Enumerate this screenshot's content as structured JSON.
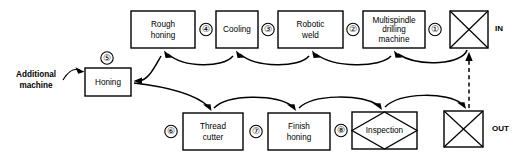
{
  "diagram": {
    "type": "manufacturing-process-flow",
    "title": "",
    "nodes": [
      {
        "id": "in",
        "label": "IN",
        "shape": "crossed-square",
        "step": "",
        "row": "top",
        "x": 450,
        "y": 11,
        "w": 38,
        "h": 37
      },
      {
        "id": "multispindle",
        "label": "Multispindle drilling machine",
        "shape": "rect",
        "step": "①",
        "row": "top",
        "x": 363,
        "y": 11,
        "w": 62,
        "h": 37
      },
      {
        "id": "robotic",
        "label": "Robotic weld",
        "shape": "rect",
        "step": "②",
        "row": "top",
        "x": 278,
        "y": 11,
        "w": 65,
        "h": 37
      },
      {
        "id": "cooling",
        "label": "Cooling",
        "shape": "rect",
        "step": "③",
        "row": "top",
        "x": 216,
        "y": 11,
        "w": 42,
        "h": 37
      },
      {
        "id": "rough",
        "label": "Rough honing",
        "shape": "rect",
        "step": "④",
        "row": "top",
        "x": 131,
        "y": 11,
        "w": 64,
        "h": 37
      },
      {
        "id": "honing",
        "label": "Honing",
        "shape": "rect",
        "step": "⑤",
        "row": "middle",
        "x": 85,
        "y": 68,
        "w": 46,
        "h": 28
      },
      {
        "id": "thread",
        "label": "Thread cutter",
        "shape": "rect",
        "step": "⑥",
        "row": "bottom",
        "x": 183,
        "y": 113,
        "w": 60,
        "h": 37
      },
      {
        "id": "finish",
        "label": "Finish honing",
        "shape": "rect",
        "step": "⑦",
        "row": "bottom",
        "x": 268,
        "y": 113,
        "w": 62,
        "h": 37
      },
      {
        "id": "inspection",
        "label": "Inspection",
        "shape": "diamond-in-rect",
        "step": "⑧",
        "row": "bottom",
        "x": 352,
        "y": 112,
        "w": 65,
        "h": 37
      },
      {
        "id": "out",
        "label": "OUT",
        "shape": "crossed-square",
        "step": "",
        "row": "bottom",
        "x": 444,
        "y": 111,
        "w": 39,
        "h": 36
      }
    ],
    "node_labels": {
      "rough_honing_line1": "Rough",
      "rough_honing_line2": "honing",
      "cooling": "Cooling",
      "robotic_line1": "Robotic",
      "robotic_line2": "weld",
      "multispindle_line1": "Multispindle",
      "multispindle_line2": "drilling",
      "multispindle_line3": "machine",
      "honing": "Honing",
      "thread_line1": "Thread",
      "thread_line2": "cutter",
      "finish_line1": "Finish",
      "finish_line2": "honing",
      "inspection": "Inspection",
      "additional_line1": "Additional",
      "additional_line2": "machine",
      "in": "IN",
      "out": "OUT"
    },
    "step_numbers": {
      "multispindle": "①",
      "robotic": "②",
      "cooling": "③",
      "rough_honing": "④",
      "honing": "⑤",
      "thread_cutter": "⑥",
      "finish_honing": "⑦",
      "inspection": "⑧"
    },
    "edges": [
      {
        "from": "out",
        "to": "in",
        "style": "dashed",
        "direction": "up"
      },
      {
        "from": "in",
        "to": "multispindle",
        "style": "curved",
        "direction": "left"
      },
      {
        "from": "multispindle",
        "to": "robotic",
        "style": "curved",
        "direction": "left"
      },
      {
        "from": "robotic",
        "to": "cooling",
        "style": "curved",
        "direction": "left"
      },
      {
        "from": "cooling",
        "to": "rough",
        "style": "curved",
        "direction": "left"
      },
      {
        "from": "rough",
        "to": "honing",
        "style": "curved",
        "direction": "left"
      },
      {
        "from": "honing",
        "to": "thread",
        "style": "curved",
        "direction": "right"
      },
      {
        "from": "thread",
        "to": "finish",
        "style": "curved",
        "direction": "right"
      },
      {
        "from": "finish",
        "to": "inspection",
        "style": "curved",
        "direction": "right"
      },
      {
        "from": "inspection",
        "to": "out",
        "style": "curved",
        "direction": "right"
      },
      {
        "from": "additional",
        "to": "honing",
        "style": "curved",
        "direction": "right"
      }
    ],
    "colors": {
      "stroke": "#000000",
      "fill": "#ffffff",
      "background": "#ffffff"
    }
  }
}
